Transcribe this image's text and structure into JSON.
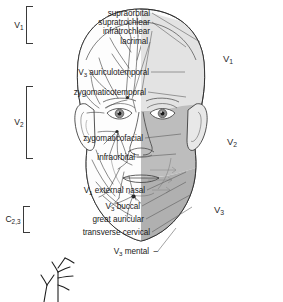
{
  "figure": {
    "view": "anterior-frontal-head",
    "left_half": "nerve-branch-line-drawing",
    "right_half": "shaded-dermatome-territories"
  },
  "groups": [
    {
      "id": "v1",
      "tag": "V",
      "sub": "1",
      "members": [
        "supraorbital",
        "supratrochlear",
        "infratrochlear",
        "lacrimal"
      ]
    },
    {
      "id": "v2",
      "tag": "V",
      "sub": "2",
      "members": [
        "zygomaticotemporal",
        "zygomaticofacial",
        "infraorbital"
      ]
    },
    {
      "id": "c23",
      "tag": "C",
      "sub": "2,3",
      "members": [
        "great auricular",
        "transverse cervical"
      ]
    }
  ],
  "labels": [
    {
      "id": "supraorbital",
      "text": "supraorbital",
      "prefix": "",
      "prefix_sub": ""
    },
    {
      "id": "supratrochlear",
      "text": "supratrochlear",
      "prefix": "",
      "prefix_sub": ""
    },
    {
      "id": "infratrochlear",
      "text": "infratrochlear",
      "prefix": "",
      "prefix_sub": ""
    },
    {
      "id": "lacrimal",
      "text": "lacrimal",
      "prefix": "",
      "prefix_sub": ""
    },
    {
      "id": "auriculotemporal",
      "text": "auriculotemporal",
      "prefix": "V",
      "prefix_sub": "3"
    },
    {
      "id": "zygomaticotemporal",
      "text": "zygomaticotemporal",
      "prefix": "",
      "prefix_sub": ""
    },
    {
      "id": "zygomaticofacial",
      "text": "zygomaticofacial",
      "prefix": "",
      "prefix_sub": ""
    },
    {
      "id": "infraorbital",
      "text": "infraorbital",
      "prefix": "",
      "prefix_sub": ""
    },
    {
      "id": "external-nasal",
      "text": "external nasal",
      "prefix": "V",
      "prefix_sub": "1"
    },
    {
      "id": "buccal",
      "text": "buccal",
      "prefix": "V",
      "prefix_sub": "3"
    },
    {
      "id": "great-auricular",
      "text": "great auricular",
      "prefix": "",
      "prefix_sub": ""
    },
    {
      "id": "transverse-cervical",
      "text": "transverse cervical",
      "prefix": "",
      "prefix_sub": ""
    },
    {
      "id": "mental",
      "text": "mental",
      "prefix": "V",
      "prefix_sub": "3"
    }
  ],
  "regions": [
    {
      "id": "region-v1",
      "tag": "V",
      "sub": "1",
      "color": "#e3e3e3",
      "name": "ophthalmic-division-territory"
    },
    {
      "id": "region-v2",
      "tag": "V",
      "sub": "2",
      "color": "#bdbdbd",
      "name": "maxillary-division-territory"
    },
    {
      "id": "region-v3",
      "tag": "V",
      "sub": "3",
      "color": "#b0b0b0",
      "name": "mandibular-division-territory"
    }
  ],
  "colors": {
    "background": "#ffffff",
    "outline": "#2b2b2b",
    "leader": "#555555",
    "skin_light": "#f4f4f4",
    "v1_fill": "#e3e3e3",
    "v2_fill": "#bdbdbd",
    "v3_fill": "#b0b0b0",
    "nerve_stroke": "#3c3c3c",
    "text": "#1a1a1a"
  }
}
